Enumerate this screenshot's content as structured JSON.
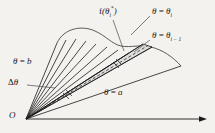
{
  "figure": {
    "background_color": "#f4f2ef",
    "stroke_color": "#1a1a1a",
    "wedge_fill_color": "#d8d8d8",
    "origin_label": "O",
    "labels": {
      "sample_value": "f(θᵢ*)",
      "sample_value_parts": {
        "fn": "f",
        "open": "(",
        "theta": "θ",
        "sub": "i",
        "sup": "*",
        "close": ")"
      },
      "upper_ray": "θ = θᵢ",
      "upper_ray_parts": {
        "theta": "θ",
        "eq": " = ",
        "theta2": "θ",
        "sub": "i"
      },
      "lower_ray": "θ = θᵢ₋₁",
      "lower_ray_parts": {
        "theta": "θ",
        "eq": " = ",
        "theta2": "θ",
        "sub": "i − 1"
      },
      "upper_limit": "θ = b",
      "upper_limit_parts": {
        "theta": "θ",
        "eq": " = ",
        "value": "b"
      },
      "delta": "Δθ",
      "delta_parts": {
        "delta": "Δ",
        "theta": "θ"
      },
      "lower_limit": "θ = a",
      "lower_limit_parts": {
        "theta": "θ",
        "eq": " = ",
        "value": "a"
      }
    },
    "elements": {
      "polar_axis": "horizontal-ray-with-arrowhead",
      "curve": "r = f(theta) outer boundary",
      "fan_ray_count": 11,
      "highlighted_wedge": "i-th subdivision with dashed mid-ray"
    }
  }
}
